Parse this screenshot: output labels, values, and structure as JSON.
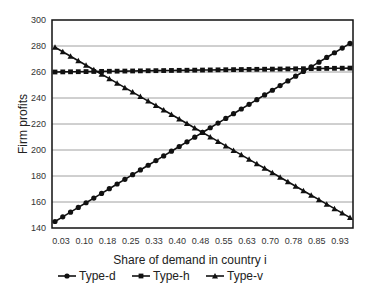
{
  "chart_data": {
    "type": "line",
    "title": "",
    "xlabel": "Share of demand in country i",
    "ylabel": "Firm profits",
    "ylim": [
      140,
      300
    ],
    "yticks": [
      140,
      160,
      180,
      200,
      220,
      240,
      260,
      280,
      300
    ],
    "xtick_labels": [
      "0.03",
      "0.10",
      "0.18",
      "0.25",
      "0.33",
      "0.40",
      "0.48",
      "0.55",
      "0.63",
      "0.70",
      "0.78",
      "0.85",
      "0.93"
    ],
    "xrange": [
      0.025,
      0.975
    ],
    "grid": "horizontal",
    "legend_position": "bottom",
    "series": [
      {
        "name": "Type-d",
        "marker": "circle",
        "start": 145,
        "end": 282
      },
      {
        "name": "Type-h",
        "marker": "square",
        "start": 260,
        "end": 263
      },
      {
        "name": "Type-v",
        "marker": "triangle",
        "start": 279,
        "end": 148
      }
    ],
    "points_per_series": 39
  },
  "legend": {
    "items": [
      "Type-d",
      "Type-h",
      "Type-v"
    ]
  }
}
